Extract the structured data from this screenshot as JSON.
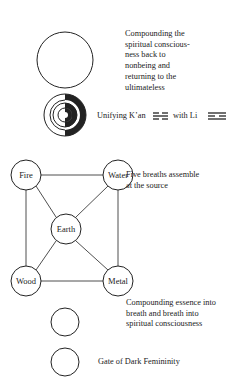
{
  "stages": [
    {
      "id": "ultimateless",
      "caption": "Compounding the spiritual conscious- ness back to nonbeing and returning to the ultimateless",
      "lines": [
        "Compounding the",
        "spiritual conscious-",
        "ness back to",
        "nonbeing and",
        "returning to the",
        "ultimateless"
      ]
    },
    {
      "id": "kan-li",
      "caption_prefix": "Unifying K’an",
      "caption_middle": "with Li",
      "trigrams": {
        "kan": "☵",
        "li": "☲"
      }
    },
    {
      "id": "five-breaths",
      "lines": [
        "Five breaths assemble",
        "at the source"
      ],
      "nodes": {
        "fire": "Fire",
        "water": "Water",
        "earth": "Earth",
        "wood": "Wood",
        "metal": "Metal"
      }
    },
    {
      "id": "essence",
      "lines": [
        "Compounding essence into",
        "breath and breath into",
        "spiritual consciousness"
      ]
    },
    {
      "id": "gate",
      "caption": "Gate of Dark Femininity"
    }
  ],
  "colors": {
    "ink": "#222222",
    "background": "#ffffff"
  }
}
